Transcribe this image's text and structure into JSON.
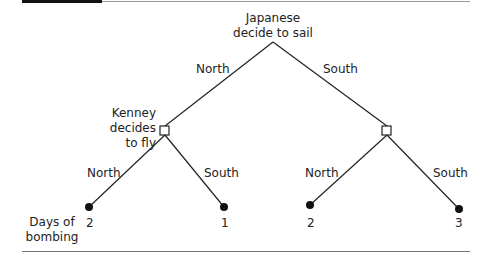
{
  "diagram": {
    "type": "game-tree",
    "root": {
      "label_line1": "Japanese",
      "label_line2": "decide to sail"
    },
    "first_branches": {
      "left": "North",
      "right": "South"
    },
    "kenney_node": {
      "line1": "Kenney",
      "line2": "decides",
      "line3": "to fly"
    },
    "second_branches": {
      "left_left": "North",
      "left_right": "South",
      "right_left": "North",
      "right_right": "South"
    },
    "payoff_label": {
      "line1": "Days of",
      "line2": "bombing"
    },
    "payoffs": [
      "2",
      "1",
      "2",
      "3"
    ]
  }
}
